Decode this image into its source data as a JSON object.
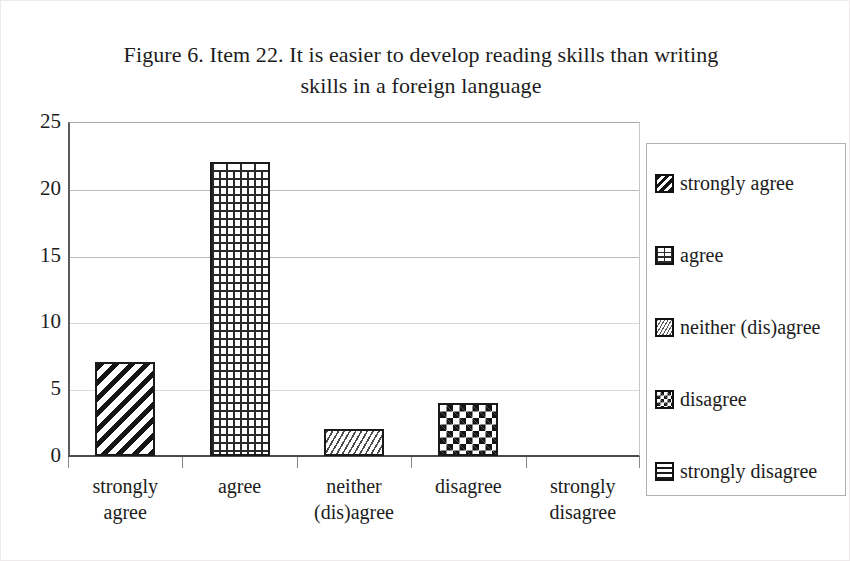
{
  "chart_data": {
    "type": "bar",
    "title": "Figure 6. Item 22. It is easier to develop reading skills than writing skills in a foreign language",
    "title_line1": "Figure 6. Item 22. It is easier to develop reading skills than writing",
    "title_line2": "skills in a foreign language",
    "categories": [
      "strongly agree",
      "agree",
      "neither (dis)agree",
      "disagree",
      "strongly disagree"
    ],
    "category_lines": [
      [
        "strongly",
        "agree"
      ],
      [
        "agree",
        ""
      ],
      [
        "neither",
        "(dis)agree"
      ],
      [
        "disagree",
        ""
      ],
      [
        "strongly",
        "disagree"
      ]
    ],
    "values": [
      7,
      22,
      2,
      4,
      0
    ],
    "xlabel": "",
    "ylabel": "",
    "ylim": [
      0,
      25
    ],
    "ytick_labels": [
      "25",
      "20",
      "15",
      "10",
      "5",
      "0"
    ],
    "ytick_values": [
      25,
      20,
      15,
      10,
      5,
      0
    ],
    "grid": true,
    "legend_position": "right",
    "legend": [
      {
        "label": "strongly agree",
        "pattern": "diagonal-stripes"
      },
      {
        "label": "agree",
        "pattern": "brick"
      },
      {
        "label": "neither (dis)agree",
        "pattern": "fine-zigzag"
      },
      {
        "label": "disagree",
        "pattern": "checkerboard"
      },
      {
        "label": "strongly disagree",
        "pattern": "horizontal-lines"
      }
    ],
    "colors": {
      "background": "#ffffff",
      "bar_outline": "#1a1a1a",
      "bar_fill": "#ffffff",
      "gridline": "#b9b9b9",
      "axis": "#4a4a4a",
      "text": "#1c1c1c",
      "legend_border": "#b0b0b0"
    }
  }
}
